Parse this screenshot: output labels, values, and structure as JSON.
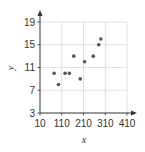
{
  "chart_data": {
    "type": "scatter",
    "title": "",
    "xlabel": "x",
    "ylabel": "y",
    "xlim": [
      10,
      410
    ],
    "ylim": [
      3,
      19
    ],
    "xticks": [
      10,
      110,
      210,
      310,
      410
    ],
    "yticks": [
      3,
      7,
      11,
      15,
      19
    ],
    "grid": true,
    "legend": null,
    "points": [
      {
        "x": 75,
        "y": 10
      },
      {
        "x": 95,
        "y": 8
      },
      {
        "x": 125,
        "y": 10
      },
      {
        "x": 145,
        "y": 10
      },
      {
        "x": 165,
        "y": 13
      },
      {
        "x": 195,
        "y": 9
      },
      {
        "x": 215,
        "y": 12
      },
      {
        "x": 255,
        "y": 13
      },
      {
        "x": 280,
        "y": 15
      },
      {
        "x": 290,
        "y": 16
      }
    ],
    "colors": {
      "point": "#555555",
      "grid": "#d9d9d9",
      "axis": "#333333"
    }
  }
}
